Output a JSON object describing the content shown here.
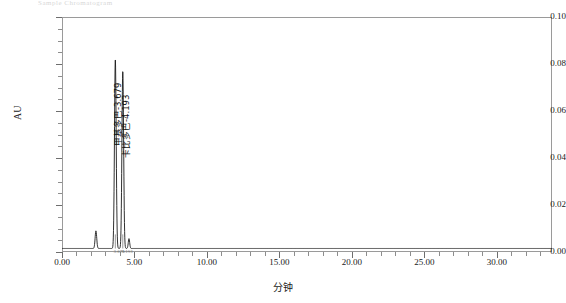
{
  "header": {
    "smudge_text": "Sample Chromatogram"
  },
  "chart_data": {
    "type": "line",
    "title": "",
    "xlabel": "分钟",
    "ylabel": "AU",
    "xlim": [
      0.0,
      33.8
    ],
    "ylim": [
      0.0,
      0.1
    ],
    "grid": false,
    "legend": "none",
    "x_ticks": [
      {
        "value": 0.0,
        "label": "0.00"
      },
      {
        "value": 5.0,
        "label": "5.00"
      },
      {
        "value": 10.0,
        "label": "10.00"
      },
      {
        "value": 15.0,
        "label": "15.00"
      },
      {
        "value": 20.0,
        "label": "20.00"
      },
      {
        "value": 25.0,
        "label": "25.00"
      },
      {
        "value": 30.0,
        "label": "30.00"
      }
    ],
    "x_minor_step": 1.0,
    "y_ticks": [
      {
        "value": 0.0,
        "label": "0.00"
      },
      {
        "value": 0.02,
        "label": "0.02"
      },
      {
        "value": 0.04,
        "label": "0.04"
      },
      {
        "value": 0.06,
        "label": "0.06"
      },
      {
        "value": 0.08,
        "label": "0.08"
      },
      {
        "value": 0.1,
        "label": "0.10"
      }
    ],
    "y_minor_step": 0.005,
    "baseline_au": 0.0015,
    "peaks": [
      {
        "name": "甲基多巴",
        "retention_time": 3.679,
        "height_au": 0.0805,
        "width_min": 0.17,
        "label": "甲基多巴-3.679",
        "labeled": true
      },
      {
        "name": "卡比多巴",
        "retention_time": 4.193,
        "height_au": 0.0755,
        "width_min": 0.17,
        "label": "卡比多巴-4.193",
        "labeled": true
      },
      {
        "name": "",
        "retention_time": 2.34,
        "height_au": 0.0075,
        "width_min": 0.16,
        "label": "",
        "labeled": false
      },
      {
        "name": "",
        "retention_time": 4.62,
        "height_au": 0.0042,
        "width_min": 0.14,
        "label": "",
        "labeled": false
      }
    ],
    "rt_annotations": [
      {
        "x": 3.55,
        "text": "3.679"
      },
      {
        "x": 4.1,
        "text": "4.193"
      }
    ],
    "trace_color": "#1a1a1a"
  }
}
